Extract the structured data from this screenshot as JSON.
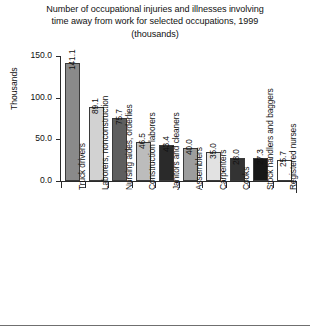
{
  "chart_data": {
    "type": "bar",
    "title": "Number of occupational injuries and illnesses involving time away from work for selected occupations, 1999 (thousands)",
    "title_lines": [
      "Number of occupational injuries and illnesses involving",
      "time away from work for selected occupations, 1999",
      "(thousands)"
    ],
    "xlabel": "",
    "ylabel": "Thousands",
    "ylim": [
      0.0,
      150.0
    ],
    "yticks": [
      "0.0",
      "50.0",
      "100.0",
      "150.0"
    ],
    "ytick_values": [
      0.0,
      50.0,
      100.0,
      150.0
    ],
    "grid": false,
    "legend": false,
    "categories": [
      "Truck drivers",
      "Laborers, nonconstruction",
      "Nursing aides, orderlies",
      "Construction laborers",
      "Janitors and cleaners",
      "Assemblers",
      "Carpenters",
      "Cooks",
      "Stock handlers and baggers",
      "Registered nurses"
    ],
    "values": [
      141.1,
      89.1,
      75.7,
      46.5,
      43.4,
      40.0,
      35.0,
      28.0,
      27.3,
      25.7
    ],
    "value_labels": [
      "141.1",
      "89.1",
      "75.7",
      "46.5",
      "43.4",
      "40.0",
      "35.0",
      "28.0",
      "27.3",
      "25.7"
    ],
    "bar_colors": [
      "#8a8a8a",
      "#d2d2d2",
      "#5e5e5e",
      "#bcbcbc",
      "#2a2a2a",
      "#9d9d9d",
      "#e2e2e2",
      "#333333",
      "#171717",
      "#ffffff"
    ],
    "axis_color": "#2b2b2b",
    "text_color": "#111111",
    "background": "#ffffff"
  }
}
